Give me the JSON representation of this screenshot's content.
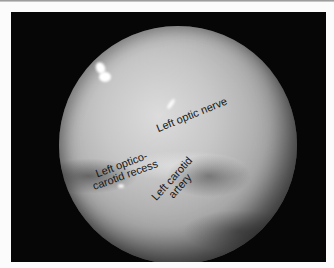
{
  "figure": {
    "background_color": "#060606",
    "labels": {
      "optic_nerve": "Left optic nerve",
      "recess_line1": "Left optico-",
      "recess_line2": "carotid recess",
      "carotid_line1": "Left carotid",
      "carotid_line2": "artery"
    }
  }
}
